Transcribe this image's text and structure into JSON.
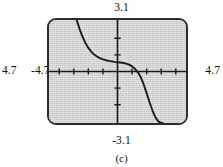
{
  "figure": {
    "caption": "(c)",
    "labels": {
      "y_max": "3.1",
      "y_min": "-3.1",
      "x_min": "-4.7",
      "x_max": "4.7",
      "x_far_left": "4.7"
    },
    "screen": {
      "background_color": "#c9c9c9",
      "border_color": "#2b2b2b",
      "curve_color": "#1a1a1a"
    }
  },
  "chart_data": {
    "type": "line",
    "title": "",
    "subtitle": "",
    "xlabel": "",
    "ylabel": "",
    "xlim": [
      -4.7,
      4.7
    ],
    "ylim": [
      -3.1,
      3.1
    ],
    "grid": false,
    "legend": null,
    "axes": {
      "x_axis_visible": true,
      "y_axis_visible": true,
      "x_tick_step": 1,
      "y_tick_step": 1,
      "x_ticks": [
        -4,
        -3,
        -2,
        -1,
        1,
        2,
        3,
        4
      ],
      "y_ticks": [
        -2,
        -1,
        1,
        2
      ]
    },
    "annotations": [
      "Viewing window -4.7 to 4.7 by -3.1 to 3.1",
      "Decreasing curve with a flat plateau near y = 0.5, steeply falling on both sides"
    ],
    "series": [
      {
        "name": "curve",
        "x": [
          -2.8,
          -2.6,
          -2.4,
          -2.2,
          -2.0,
          -1.8,
          -1.6,
          -1.4,
          -1.2,
          -1.0,
          -0.8,
          -0.6,
          -0.4,
          -0.2,
          0.0,
          0.2,
          0.4,
          0.6,
          0.8,
          1.0,
          1.2,
          1.4,
          1.6,
          1.8,
          2.0,
          2.2,
          2.4,
          2.6,
          2.8,
          3.0,
          3.1
        ],
        "y": [
          3.1,
          2.55,
          2.1,
          1.72,
          1.42,
          1.2,
          1.02,
          0.9,
          0.8,
          0.73,
          0.68,
          0.64,
          0.61,
          0.58,
          0.56,
          0.54,
          0.51,
          0.47,
          0.41,
          0.31,
          0.16,
          -0.05,
          -0.35,
          -0.78,
          -1.3,
          -1.85,
          -2.35,
          -2.75,
          -3.0,
          -3.1,
          -3.1
        ]
      }
    ]
  }
}
